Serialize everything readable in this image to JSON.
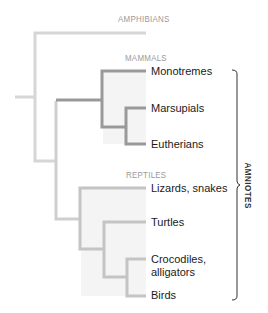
{
  "diagram": {
    "type": "phylogenetic-tree",
    "colors": {
      "amphibian_branch": "#d6d6d6",
      "amniote_branch": "#cfcfcf",
      "mammal_branch": "#999999",
      "reptile_branch": "#c4c4c4",
      "clade_fill": "#f4f4f4",
      "group_label": "#9a9a9a",
      "bracket": "#333333"
    },
    "groups": {
      "amphibians": "AMPHIBIANS",
      "mammals": "MAMMALS",
      "reptiles": "REPTILES"
    },
    "taxa": {
      "monotremes": "Monotremes",
      "marsupials": "Marsupials",
      "eutherians": "Eutherians",
      "lizards_snakes": "Lizards, snakes",
      "turtles": "Turtles",
      "crocodiles_line1": "Crocodiles,",
      "crocodiles_line2": "alligators",
      "birds": "Birds"
    },
    "bracket_label": "AMNIOTES"
  }
}
